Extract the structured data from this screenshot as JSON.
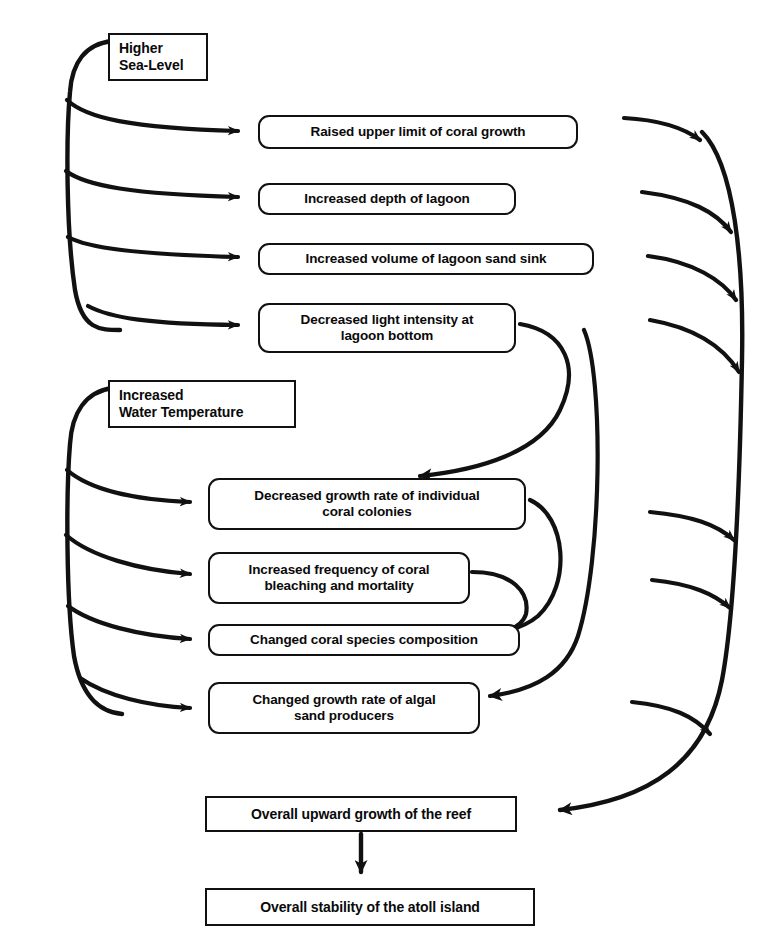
{
  "diagram": {
    "type": "flowchart",
    "background_color": "#ffffff",
    "line_color": "#111111",
    "text_color": "#0a0a0a"
  },
  "nodes": {
    "higher_sea_level": {
      "id": "higher-sea-level",
      "label": "Higher\nSea-Level",
      "shape": "rectangle",
      "role": "driver",
      "x": 108,
      "y": 33,
      "w": 100,
      "h": 48,
      "font_size": 14
    },
    "raised_upper_limit": {
      "id": "raised-upper-limit-of-coral-growth",
      "label": "Raised  upper limit of coral growth",
      "shape": "rounded-rectangle",
      "role": "effect",
      "x": 258,
      "y": 115,
      "w": 320,
      "h": 34,
      "font_size": 13.5
    },
    "increased_depth_lagoon": {
      "id": "increased-depth-of-lagoon",
      "label": "Increased depth of lagoon",
      "shape": "rounded-rectangle",
      "role": "effect",
      "x": 258,
      "y": 183,
      "w": 258,
      "h": 32,
      "font_size": 13.5
    },
    "increased_volume_sand_sink": {
      "id": "increased-volume-of-lagoon-sand-sink",
      "label": "Increased volume of lagoon sand sink",
      "shape": "rounded-rectangle",
      "role": "effect",
      "x": 258,
      "y": 243,
      "w": 336,
      "h": 32,
      "font_size": 13.5
    },
    "decreased_light_intensity": {
      "id": "decreased-light-intensity-at-lagoon-bottom",
      "label": "Decreased light intensity at\nlagoon bottom",
      "shape": "rounded-rectangle",
      "role": "effect",
      "x": 258,
      "y": 303,
      "w": 258,
      "h": 50,
      "font_size": 13.5
    },
    "increased_water_temperature": {
      "id": "increased-water-temperature",
      "label": "Increased\nWater Temperature",
      "shape": "rectangle",
      "role": "driver",
      "x": 108,
      "y": 380,
      "w": 188,
      "h": 48,
      "font_size": 14
    },
    "decreased_growth_rate_coral": {
      "id": "decreased-growth-rate-of-individual-coral-colonies",
      "label": "Decreased growth rate of individual\ncoral colonies",
      "shape": "rounded-rectangle",
      "role": "effect",
      "x": 208,
      "y": 478,
      "w": 318,
      "h": 52,
      "font_size": 13.5
    },
    "increased_frequency_bleaching": {
      "id": "increased-frequency-of-coral-bleaching-and-mortality",
      "label": "Increased frequency of coral\nbleaching and mortality",
      "shape": "rounded-rectangle",
      "role": "effect",
      "x": 208,
      "y": 552,
      "w": 262,
      "h": 52,
      "font_size": 13.5
    },
    "changed_coral_species": {
      "id": "changed-coral-species-composition",
      "label": "Changed coral species composition",
      "shape": "rounded-rectangle",
      "role": "effect",
      "x": 208,
      "y": 624,
      "w": 312,
      "h": 32,
      "font_size": 13.5
    },
    "changed_growth_algal": {
      "id": "changed-growth-rate-of-algal-sand-producers",
      "label": "Changed growth rate of algal\nsand producers",
      "shape": "rounded-rectangle",
      "role": "effect",
      "x": 208,
      "y": 682,
      "w": 272,
      "h": 52,
      "font_size": 13.5
    },
    "overall_upward_growth": {
      "id": "overall-upward-growth-of-the-reef",
      "label": "Overall upward growth of the reef",
      "shape": "rectangle",
      "role": "outcome",
      "x": 205,
      "y": 796,
      "w": 312,
      "h": 36,
      "font_size": 14
    },
    "overall_stability": {
      "id": "overall-stability-of-the-atoll-island",
      "label": "Overall stability of the atoll island",
      "shape": "rectangle",
      "role": "outcome",
      "x": 205,
      "y": 888,
      "w": 330,
      "h": 38,
      "font_size": 14
    }
  },
  "edges": [
    {
      "from": "higher_sea_level",
      "to": "raised_upper_limit",
      "style": "curved-arrow"
    },
    {
      "from": "higher_sea_level",
      "to": "increased_depth_lagoon",
      "style": "curved-arrow"
    },
    {
      "from": "higher_sea_level",
      "to": "increased_volume_sand_sink",
      "style": "curved-arrow"
    },
    {
      "from": "higher_sea_level",
      "to": "decreased_light_intensity",
      "style": "curved-arrow"
    },
    {
      "from": "increased_water_temperature",
      "to": "decreased_growth_rate_coral",
      "style": "curved-arrow"
    },
    {
      "from": "increased_water_temperature",
      "to": "increased_frequency_bleaching",
      "style": "curved-arrow"
    },
    {
      "from": "increased_water_temperature",
      "to": "changed_coral_species",
      "style": "curved-arrow"
    },
    {
      "from": "increased_water_temperature",
      "to": "changed_growth_algal",
      "style": "curved-arrow"
    },
    {
      "from": "decreased_light_intensity",
      "to": "decreased_growth_rate_coral",
      "style": "curved-arrow"
    },
    {
      "from": "decreased_growth_rate_coral",
      "to": "changed_coral_species",
      "style": "curved-arrow"
    },
    {
      "from": "increased_frequency_bleaching",
      "to": "changed_coral_species",
      "style": "curved-arrow"
    },
    {
      "from": "decreased_light_intensity",
      "to": "changed_growth_algal",
      "style": "curved-arrow"
    },
    {
      "from": "raised_upper_limit",
      "to": "overall_upward_growth",
      "style": "curved-arrow-trunk"
    },
    {
      "from": "increased_depth_lagoon",
      "to": "overall_upward_growth",
      "style": "curved-arrow-trunk"
    },
    {
      "from": "increased_volume_sand_sink",
      "to": "overall_upward_growth",
      "style": "curved-arrow-trunk"
    },
    {
      "from": "decreased_light_intensity",
      "to": "overall_upward_growth",
      "style": "curved-arrow-trunk"
    },
    {
      "from": "decreased_growth_rate_coral",
      "to": "overall_upward_growth",
      "style": "curved-arrow-trunk"
    },
    {
      "from": "changed_coral_species",
      "to": "overall_upward_growth",
      "style": "curved-arrow-trunk"
    },
    {
      "from": "changed_growth_algal",
      "to": "overall_upward_growth",
      "style": "curved-arrow-trunk"
    },
    {
      "from": "overall_upward_growth",
      "to": "overall_stability",
      "style": "straight-arrow-down"
    }
  ]
}
